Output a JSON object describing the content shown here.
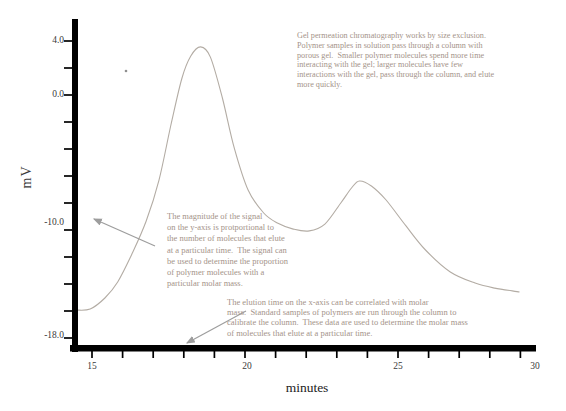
{
  "chart_data": {
    "type": "line",
    "title": "",
    "xlabel": "minutes",
    "ylabel": "mV",
    "x_axis": {
      "min": 14.4,
      "max": 29.5,
      "tick_labels": [
        "15",
        "20",
        "25",
        "30"
      ],
      "tick_values": [
        15,
        20,
        25,
        30
      ],
      "minor_tick_interval": 1
    },
    "y_axis": {
      "min": -19,
      "max": 4.6,
      "tick_labels": [
        "4.0",
        "0.0",
        "-10.0",
        "-18.0"
      ],
      "labeled_tick_values": [
        4,
        0,
        -10,
        -18
      ],
      "max_tick": 4,
      "min_tick": -18,
      "tick_step": 2
    },
    "series": [
      {
        "name": "detector-signal",
        "points": [
          [
            14.48,
            -15.93
          ],
          [
            14.94,
            -15.85
          ],
          [
            15.42,
            -15.04
          ],
          [
            15.84,
            -13.85
          ],
          [
            16.29,
            -11.85
          ],
          [
            16.77,
            -9.33
          ],
          [
            17.19,
            -6.3
          ],
          [
            17.58,
            -2.22
          ],
          [
            17.94,
            1.26
          ],
          [
            18.23,
            2.89
          ],
          [
            18.55,
            3.56
          ],
          [
            18.87,
            2.81
          ],
          [
            19.26,
            -0.22
          ],
          [
            19.65,
            -3.93
          ],
          [
            20.1,
            -7.04
          ],
          [
            20.61,
            -8.74
          ],
          [
            21.06,
            -9.48
          ],
          [
            21.58,
            -9.93
          ],
          [
            22.1,
            -10.07
          ],
          [
            22.61,
            -9.56
          ],
          [
            23.13,
            -8.0
          ],
          [
            23.48,
            -6.89
          ],
          [
            23.74,
            -6.37
          ],
          [
            24.13,
            -6.74
          ],
          [
            24.61,
            -7.78
          ],
          [
            25.26,
            -9.7
          ],
          [
            25.9,
            -11.48
          ],
          [
            26.71,
            -13.11
          ],
          [
            27.52,
            -13.93
          ],
          [
            28.16,
            -14.3
          ],
          [
            28.97,
            -14.59
          ]
        ]
      }
    ],
    "peaks": [
      {
        "time_min": 18.5,
        "signal_mV": 3.6
      },
      {
        "time_min": 23.7,
        "signal_mV": -6.4
      }
    ],
    "grid": false,
    "legend": false
  },
  "annotations": {
    "size_exclusion_note": "Gel permeation chromatography works by size exclusion.\nPolymer samples in solution pass through a column with\nporous gel.  Smaller polymer molecules spend more time\ninteracting with the gel; larger molecules have few\ninteractions with the gel, pass through the column, and elute\nmore quickly.",
    "y_axis_note": "The magnitude of the signal\non the y-axis is protportional to\nthe number of molecules that elute\nat a particular time.  The signal can\nbe used to determine the proportion\nof polymer molecules with a\nparticular molar mass.",
    "x_axis_note": "The elution time on the x-axis can be correlated with molar\nmass.  Standard samples of polymers are run through the column to\ncalibrate the column.  These data are used to determine the molar mass\nof molecules that elute at a particular time."
  },
  "colors": {
    "background": "#ffffff",
    "axis": "#000000",
    "tick_label": "#3a3a3a",
    "curve": "#b3aca4",
    "annotation_text": "#a49389",
    "arrow": "#9d9d9d"
  }
}
